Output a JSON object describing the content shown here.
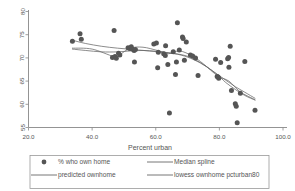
{
  "chart_data": {
    "type": "scatter",
    "title": "",
    "xlabel": "Percent urban",
    "ylabel": "",
    "xlim": [
      20.0,
      100.0
    ],
    "ylim": [
      55,
      80
    ],
    "xticks": [
      "20.0",
      "40.0",
      "60.0",
      "80.0",
      "100.0"
    ],
    "xtick_values": [
      20.0,
      40.0,
      60.0,
      80.0,
      100.0
    ],
    "yticks": [
      "55",
      "60",
      "65",
      "70",
      "75",
      "80"
    ],
    "ytick_values": [
      55,
      60,
      65,
      70,
      75,
      80
    ],
    "grid": false,
    "legend_position": "bottom",
    "marker_color": "#555555",
    "line_color": "#666666",
    "series": [
      {
        "name": "% who own home",
        "type": "scatter",
        "points": [
          [
            33.8,
            73.6
          ],
          [
            36.2,
            75.2
          ],
          [
            36.6,
            74.0
          ],
          [
            46.4,
            70.1
          ],
          [
            46.9,
            75.9
          ],
          [
            47.2,
            70.3
          ],
          [
            47.6,
            69.9
          ],
          [
            48.3,
            71.0
          ],
          [
            48.7,
            70.6
          ],
          [
            51.3,
            72.2
          ],
          [
            51.8,
            72.0
          ],
          [
            52.3,
            72.4
          ],
          [
            52.6,
            71.9
          ],
          [
            53.2,
            71.6
          ],
          [
            53.6,
            71.8
          ],
          [
            53.3,
            69.1
          ],
          [
            59.4,
            73.0
          ],
          [
            60.2,
            73.2
          ],
          [
            60.8,
            71.2
          ],
          [
            60.6,
            67.9
          ],
          [
            62.5,
            70.9
          ],
          [
            63.0,
            70.5
          ],
          [
            63.1,
            72.6
          ],
          [
            63.8,
            68.6
          ],
          [
            64.3,
            58.1
          ],
          [
            65.5,
            71.3
          ],
          [
            66.2,
            66.4
          ],
          [
            66.5,
            69.1
          ],
          [
            66.8,
            77.6
          ],
          [
            67.4,
            71.7
          ],
          [
            68.4,
            74.5
          ],
          [
            68.6,
            74.2
          ],
          [
            69.0,
            69.5
          ],
          [
            69.6,
            73.4
          ],
          [
            70.9,
            70.6
          ],
          [
            71.6,
            70.4
          ],
          [
            72.5,
            70.0
          ],
          [
            73.3,
            66.2
          ],
          [
            78.8,
            69.7
          ],
          [
            79.3,
            66.0
          ],
          [
            79.6,
            65.9
          ],
          [
            79.8,
            65.6
          ],
          [
            80.4,
            69.0
          ],
          [
            82.6,
            69.8
          ],
          [
            82.9,
            70.1
          ],
          [
            83.0,
            68.0
          ],
          [
            83.4,
            72.5
          ],
          [
            83.8,
            63.0
          ],
          [
            85.0,
            60.1
          ],
          [
            85.3,
            59.6
          ],
          [
            85.6,
            56.0
          ],
          [
            86.6,
            62.4
          ],
          [
            88.0,
            69.2
          ],
          [
            91.2,
            58.7
          ]
        ]
      },
      {
        "name": "Median spline",
        "type": "line",
        "points": [
          [
            33.8,
            72.1
          ],
          [
            40.0,
            71.9
          ],
          [
            46.8,
            70.3
          ],
          [
            48.5,
            70.6
          ],
          [
            52.0,
            72.1
          ],
          [
            56.0,
            72.3
          ],
          [
            60.5,
            71.6
          ],
          [
            64.0,
            70.9
          ],
          [
            67.5,
            71.5
          ],
          [
            71.5,
            70.4
          ],
          [
            75.0,
            68.7
          ],
          [
            79.5,
            66.1
          ],
          [
            83.0,
            65.0
          ],
          [
            86.5,
            62.7
          ],
          [
            91.2,
            61.0
          ]
        ]
      },
      {
        "name": "predicted ownhome",
        "type": "line",
        "points": [
          [
            33.8,
            73.8
          ],
          [
            38.0,
            73.1
          ],
          [
            43.0,
            72.5
          ],
          [
            48.0,
            72.1
          ],
          [
            53.0,
            71.8
          ],
          [
            58.0,
            71.5
          ],
          [
            63.0,
            71.2
          ],
          [
            68.0,
            70.6
          ],
          [
            72.0,
            69.6
          ],
          [
            76.0,
            68.1
          ],
          [
            79.5,
            66.3
          ],
          [
            82.0,
            64.7
          ],
          [
            85.0,
            63.2
          ],
          [
            88.0,
            61.9
          ],
          [
            91.2,
            60.9
          ]
        ]
      },
      {
        "name": "lowess ownhome pcturban80",
        "type": "line",
        "points": [
          [
            33.8,
            71.9
          ],
          [
            38.0,
            71.6
          ],
          [
            43.0,
            71.3
          ],
          [
            48.0,
            71.3
          ],
          [
            52.0,
            71.5
          ],
          [
            56.0,
            71.6
          ],
          [
            60.0,
            71.4
          ],
          [
            64.0,
            71.1
          ],
          [
            68.0,
            70.7
          ],
          [
            71.0,
            70.1
          ],
          [
            74.0,
            69.0
          ],
          [
            77.0,
            67.6
          ],
          [
            79.5,
            66.4
          ],
          [
            82.0,
            65.2
          ],
          [
            85.0,
            63.8
          ],
          [
            88.0,
            62.6
          ],
          [
            91.2,
            61.3
          ]
        ]
      }
    ]
  },
  "legend": {
    "entries": [
      {
        "label": "% who own home",
        "marker": "dot"
      },
      {
        "label": "Median spline",
        "marker": "line"
      },
      {
        "label": "predicted ownhome",
        "marker": "line"
      },
      {
        "label": "lowess ownhome pcturban80",
        "marker": "line"
      }
    ]
  }
}
